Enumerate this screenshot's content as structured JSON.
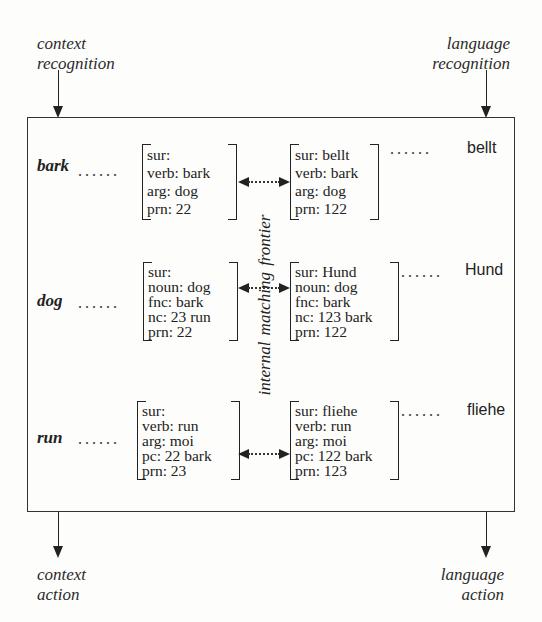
{
  "corners": {
    "top_left": {
      "line1": "context",
      "line2": "recognition"
    },
    "top_right": {
      "line1": "language",
      "line2": "recognition"
    },
    "bottom_left": {
      "line1": "context",
      "line2": "action"
    },
    "bottom_right": {
      "line1": "language",
      "line2": "action"
    }
  },
  "frontier_label": "internal matching frontier",
  "dots": "......",
  "rows": [
    {
      "concept": "bark",
      "context_avm": [
        "sur:",
        "verb: bark",
        "arg: dog",
        "prn: 22"
      ],
      "language_avm": [
        "sur: bellt",
        "verb: bark",
        "arg: dog",
        "prn: 122"
      ],
      "surface": "bellt"
    },
    {
      "concept": "dog",
      "context_avm": [
        "sur:",
        "noun: dog",
        "fnc: bark",
        "nc: 23 run",
        "prn: 22"
      ],
      "language_avm": [
        "sur: Hund",
        "noun: dog",
        "fnc: bark",
        "nc: 123 bark",
        "prn: 122"
      ],
      "surface": "Hund"
    },
    {
      "concept": "run",
      "context_avm": [
        "sur:",
        "verb: run",
        "arg: moi",
        "pc: 22 bark",
        "prn: 23"
      ],
      "language_avm": [
        "sur: fliehe",
        "verb: run",
        "arg: moi",
        "pc: 122 bark",
        "prn: 123"
      ],
      "surface": "fliehe"
    }
  ]
}
